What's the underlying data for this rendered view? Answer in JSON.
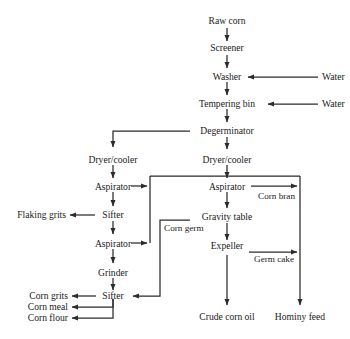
{
  "diagram": {
    "type": "process-flowchart",
    "colors": {
      "line": "#2b2b2b",
      "text": "#1a1a1a",
      "background": "#ffffff"
    },
    "nodes": {
      "raw_corn": "Raw corn",
      "screener": "Screener",
      "washer": "Washer",
      "water_1": "Water",
      "tempering_bin": "Tempering bin",
      "water_2": "Water",
      "degerminator": "Degerminator",
      "dryer_cooler_left": "Dryer/cooler",
      "dryer_cooler_right": "Dryer/cooler",
      "aspirator_left_1": "Aspirator",
      "aspirator_right": "Aspirator",
      "corn_bran": "Corn bran",
      "flaking_grits": "Flaking grits",
      "sifter_1": "Sifter",
      "gravity_table": "Gravity table",
      "corn_germ": "Corn germ",
      "aspirator_left_2": "Aspirator",
      "expeller": "Expeller",
      "germ_cake": "Germ cake",
      "grinder": "Grinder",
      "sifter_2": "Sifter",
      "corn_grits": "Corn grits",
      "corn_meal": "Corn meal",
      "corn_flour": "Corn flour",
      "crude_corn_oil": "Crude corn oil",
      "hominy_feed": "Hominy feed"
    },
    "edges": [
      {
        "from": "raw_corn",
        "to": "screener",
        "label": ""
      },
      {
        "from": "screener",
        "to": "washer",
        "label": ""
      },
      {
        "from": "water_1",
        "to": "washer",
        "label": ""
      },
      {
        "from": "washer",
        "to": "tempering_bin",
        "label": ""
      },
      {
        "from": "water_2",
        "to": "tempering_bin",
        "label": ""
      },
      {
        "from": "tempering_bin",
        "to": "degerminator",
        "label": ""
      },
      {
        "from": "degerminator",
        "to": "dryer_cooler_left",
        "label": ""
      },
      {
        "from": "degerminator",
        "to": "dryer_cooler_right",
        "label": ""
      },
      {
        "from": "dryer_cooler_left",
        "to": "aspirator_left_1",
        "label": ""
      },
      {
        "from": "dryer_cooler_right",
        "to": "aspirator_right",
        "label": ""
      },
      {
        "from": "aspirator_left_1",
        "to": "sifter_1",
        "label": ""
      },
      {
        "from": "aspirator_left_1",
        "to": "gravity_table",
        "label": ""
      },
      {
        "from": "sifter_1",
        "to": "flaking_grits",
        "label": ""
      },
      {
        "from": "sifter_1",
        "to": "aspirator_left_2",
        "label": ""
      },
      {
        "from": "aspirator_left_2",
        "to": "gravity_table",
        "label": ""
      },
      {
        "from": "aspirator_left_2",
        "to": "grinder",
        "label": ""
      },
      {
        "from": "aspirator_right",
        "to": "gravity_table",
        "label": ""
      },
      {
        "from": "aspirator_right",
        "to": "hominy_feed",
        "label": "Corn bran"
      },
      {
        "from": "gravity_table",
        "to": "expeller",
        "label": ""
      },
      {
        "from": "gravity_table",
        "to": "sifter_2",
        "label": "Corn germ"
      },
      {
        "from": "expeller",
        "to": "crude_corn_oil",
        "label": ""
      },
      {
        "from": "expeller",
        "to": "hominy_feed",
        "label": "Germ cake"
      },
      {
        "from": "grinder",
        "to": "sifter_2",
        "label": ""
      },
      {
        "from": "sifter_2",
        "to": "corn_grits",
        "label": ""
      },
      {
        "from": "sifter_2",
        "to": "corn_meal",
        "label": ""
      },
      {
        "from": "sifter_2",
        "to": "corn_flour",
        "label": ""
      }
    ]
  }
}
